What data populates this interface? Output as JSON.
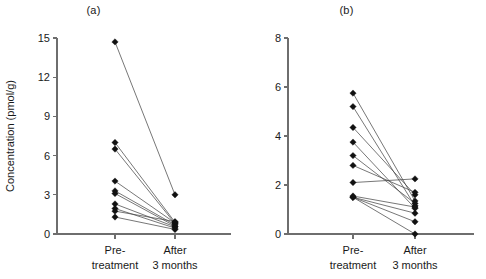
{
  "figure": {
    "background": "#ffffff",
    "marker_color": "#111111",
    "line_color": "#4a4a4a",
    "axis_color": "#6e6e6e"
  },
  "panels": [
    {
      "key": "a",
      "title": "(a)"
    },
    {
      "key": "b",
      "title": "(b)"
    }
  ],
  "chart_data": [
    {
      "type": "line",
      "panel": "(a)",
      "title": "(a)",
      "xlabel": "",
      "ylabel": "Concentration (pmol/g)",
      "categories": [
        "Pre-treatment",
        "After 3 months"
      ],
      "category_lines": [
        [
          "Pre-",
          "treatment"
        ],
        [
          "After",
          "3 months"
        ]
      ],
      "ylim": [
        0,
        15
      ],
      "yticks": [
        0,
        3,
        6,
        9,
        12,
        15
      ],
      "ytick_labels": [
        "0",
        "3",
        "6",
        "9",
        "12",
        "15"
      ],
      "grid": false,
      "legend": "none",
      "series": [
        {
          "name": "subject-1",
          "values": [
            14.7,
            3.0
          ]
        },
        {
          "name": "subject-2",
          "values": [
            7.0,
            0.9
          ]
        },
        {
          "name": "subject-3",
          "values": [
            6.5,
            0.8
          ]
        },
        {
          "name": "subject-4",
          "values": [
            4.05,
            0.85
          ]
        },
        {
          "name": "subject-5",
          "values": [
            3.3,
            0.7
          ]
        },
        {
          "name": "subject-6",
          "values": [
            3.1,
            0.6
          ]
        },
        {
          "name": "subject-7",
          "values": [
            2.3,
            0.55
          ]
        },
        {
          "name": "subject-8",
          "values": [
            1.95,
            0.45
          ]
        },
        {
          "name": "subject-9",
          "values": [
            1.75,
            0.95
          ]
        },
        {
          "name": "subject-10",
          "values": [
            1.3,
            0.35
          ]
        }
      ]
    },
    {
      "type": "line",
      "panel": "(b)",
      "title": "(b)",
      "xlabel": "",
      "ylabel": "",
      "categories": [
        "Pre-treatment",
        "After 3 months"
      ],
      "category_lines": [
        [
          "Pre-",
          "treatment"
        ],
        [
          "After",
          "3 months"
        ]
      ],
      "ylim": [
        0,
        8
      ],
      "yticks": [
        0,
        2,
        4,
        6,
        8
      ],
      "ytick_labels": [
        "0",
        "2",
        "4",
        "6",
        "8"
      ],
      "grid": false,
      "legend": "none",
      "series": [
        {
          "name": "subject-1",
          "values": [
            5.75,
            1.35
          ]
        },
        {
          "name": "subject-2",
          "values": [
            5.2,
            1.15
          ]
        },
        {
          "name": "subject-3",
          "values": [
            4.35,
            1.6
          ]
        },
        {
          "name": "subject-4",
          "values": [
            3.75,
            1.05
          ]
        },
        {
          "name": "subject-5",
          "values": [
            3.2,
            1.25
          ]
        },
        {
          "name": "subject-6",
          "values": [
            2.8,
            1.7
          ]
        },
        {
          "name": "subject-7",
          "values": [
            2.1,
            2.25
          ]
        },
        {
          "name": "subject-8",
          "values": [
            1.55,
            1.1
          ]
        },
        {
          "name": "subject-9",
          "values": [
            1.5,
            0.85
          ]
        },
        {
          "name": "subject-10",
          "values": [
            1.5,
            0.5
          ]
        },
        {
          "name": "subject-11",
          "values": [
            1.5,
            0.0
          ]
        }
      ]
    }
  ]
}
